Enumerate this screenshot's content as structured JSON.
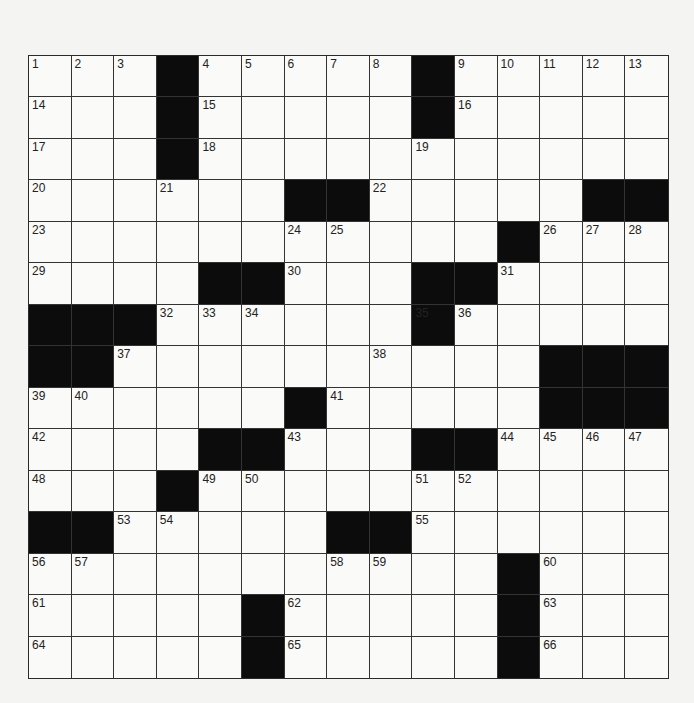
{
  "puzzle": {
    "rows": 15,
    "cols": 15,
    "colors": {
      "black": "#0c0c0c",
      "white": "#fafaf8",
      "line": "#333333"
    },
    "grid": [
      "...#.....#.....",
      "...#.....#.....",
      "...#...........",
      "......##.....##",
      "...........#...",
      "....##...##....",
      "###......#.....",
      "##..........###",
      "......#.....###",
      "....##...##....",
      "...#...........",
      "##.....##......",
      "...........#...",
      ".....#.....#...",
      ".....#.....#..."
    ],
    "numbers": [
      {
        "r": 0,
        "c": 0,
        "n": 1
      },
      {
        "r": 0,
        "c": 1,
        "n": 2
      },
      {
        "r": 0,
        "c": 2,
        "n": 3
      },
      {
        "r": 0,
        "c": 4,
        "n": 4
      },
      {
        "r": 0,
        "c": 5,
        "n": 5
      },
      {
        "r": 0,
        "c": 6,
        "n": 6
      },
      {
        "r": 0,
        "c": 7,
        "n": 7
      },
      {
        "r": 0,
        "c": 8,
        "n": 8
      },
      {
        "r": 0,
        "c": 10,
        "n": 9
      },
      {
        "r": 0,
        "c": 11,
        "n": 10
      },
      {
        "r": 0,
        "c": 12,
        "n": 11
      },
      {
        "r": 0,
        "c": 13,
        "n": 12
      },
      {
        "r": 0,
        "c": 14,
        "n": 13
      },
      {
        "r": 1,
        "c": 0,
        "n": 14
      },
      {
        "r": 1,
        "c": 4,
        "n": 15
      },
      {
        "r": 1,
        "c": 10,
        "n": 16
      },
      {
        "r": 2,
        "c": 0,
        "n": 17
      },
      {
        "r": 2,
        "c": 4,
        "n": 18
      },
      {
        "r": 2,
        "c": 9,
        "n": 19
      },
      {
        "r": 3,
        "c": 0,
        "n": 20
      },
      {
        "r": 3,
        "c": 3,
        "n": 21
      },
      {
        "r": 3,
        "c": 8,
        "n": 22
      },
      {
        "r": 4,
        "c": 0,
        "n": 23
      },
      {
        "r": 4,
        "c": 6,
        "n": 24
      },
      {
        "r": 4,
        "c": 7,
        "n": 25
      },
      {
        "r": 4,
        "c": 12,
        "n": 26
      },
      {
        "r": 4,
        "c": 13,
        "n": 27
      },
      {
        "r": 4,
        "c": 14,
        "n": 28
      },
      {
        "r": 5,
        "c": 0,
        "n": 29
      },
      {
        "r": 5,
        "c": 6,
        "n": 30
      },
      {
        "r": 5,
        "c": 11,
        "n": 31
      },
      {
        "r": 6,
        "c": 3,
        "n": 32
      },
      {
        "r": 6,
        "c": 4,
        "n": 33
      },
      {
        "r": 6,
        "c": 5,
        "n": 34
      },
      {
        "r": 6,
        "c": 9,
        "n": 35
      },
      {
        "r": 6,
        "c": 10,
        "n": 36
      },
      {
        "r": 7,
        "c": 2,
        "n": 37
      },
      {
        "r": 7,
        "c": 8,
        "n": 38
      },
      {
        "r": 8,
        "c": 0,
        "n": 39
      },
      {
        "r": 8,
        "c": 1,
        "n": 40
      },
      {
        "r": 8,
        "c": 7,
        "n": 41
      },
      {
        "r": 9,
        "c": 0,
        "n": 42
      },
      {
        "r": 9,
        "c": 6,
        "n": 43
      },
      {
        "r": 9,
        "c": 11,
        "n": 44
      },
      {
        "r": 9,
        "c": 12,
        "n": 45
      },
      {
        "r": 9,
        "c": 13,
        "n": 46
      },
      {
        "r": 9,
        "c": 14,
        "n": 47
      },
      {
        "r": 10,
        "c": 0,
        "n": 48
      },
      {
        "r": 10,
        "c": 4,
        "n": 49
      },
      {
        "r": 10,
        "c": 5,
        "n": 50
      },
      {
        "r": 10,
        "c": 9,
        "n": 51
      },
      {
        "r": 10,
        "c": 10,
        "n": 52
      },
      {
        "r": 11,
        "c": 2,
        "n": 53
      },
      {
        "r": 11,
        "c": 3,
        "n": 54
      },
      {
        "r": 11,
        "c": 9,
        "n": 55
      },
      {
        "r": 12,
        "c": 0,
        "n": 56
      },
      {
        "r": 12,
        "c": 1,
        "n": 57
      },
      {
        "r": 12,
        "c": 7,
        "n": 58
      },
      {
        "r": 12,
        "c": 8,
        "n": 59
      },
      {
        "r": 12,
        "c": 12,
        "n": 60
      },
      {
        "r": 13,
        "c": 0,
        "n": 61
      },
      {
        "r": 13,
        "c": 6,
        "n": 62
      },
      {
        "r": 13,
        "c": 12,
        "n": 63
      },
      {
        "r": 14,
        "c": 0,
        "n": 64
      },
      {
        "r": 14,
        "c": 6,
        "n": 65
      },
      {
        "r": 14,
        "c": 12,
        "n": 66
      }
    ]
  }
}
